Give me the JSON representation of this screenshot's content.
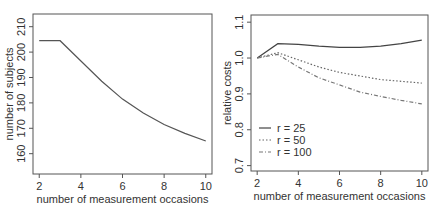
{
  "chart_data": [
    {
      "type": "line",
      "title": "",
      "xlabel": "number of measurement occasions",
      "ylabel": "number of subjects",
      "x": [
        2,
        3,
        4,
        5,
        6,
        7,
        8,
        9,
        10
      ],
      "series": [
        {
          "name": "number of subjects",
          "values": [
            204.5,
            204.5,
            196.5,
            188.5,
            181.5,
            176,
            171.5,
            168,
            165
          ],
          "style": "solid",
          "color": "#555555"
        }
      ],
      "xticks": [
        2,
        4,
        6,
        8,
        10
      ],
      "yticks": [
        160,
        170,
        180,
        190,
        200,
        210
      ],
      "xlim": [
        1.7,
        10.3
      ],
      "ylim": [
        152,
        215
      ],
      "grid": false,
      "legend": null
    },
    {
      "type": "line",
      "title": "",
      "xlabel": "number of measurement occasions",
      "ylabel": "relative costs",
      "x": [
        2,
        3,
        4,
        5,
        6,
        7,
        8,
        9,
        10
      ],
      "series": [
        {
          "name": "r = 25",
          "values": [
            1.0,
            1.04,
            1.038,
            1.033,
            1.03,
            1.03,
            1.033,
            1.04,
            1.05
          ],
          "style": "solid",
          "color": "#444444"
        },
        {
          "name": "r = 50",
          "values": [
            1.0,
            1.015,
            0.995,
            0.975,
            0.96,
            0.95,
            0.94,
            0.935,
            0.93
          ],
          "style": "dotted",
          "color": "#666666"
        },
        {
          "name": "r = 100",
          "values": [
            1.0,
            1.01,
            0.975,
            0.945,
            0.925,
            0.905,
            0.893,
            0.882,
            0.872
          ],
          "style": "dashdot",
          "color": "#777777"
        }
      ],
      "xticks": [
        2,
        4,
        6,
        8,
        10
      ],
      "yticks": [
        0.7,
        0.8,
        0.9,
        1.0,
        1.1
      ],
      "ytick_labels": [
        "0.7",
        "0.8",
        "0.9",
        "1.0",
        "1.1"
      ],
      "xlim": [
        1.7,
        10.3
      ],
      "ylim": [
        0.685,
        1.12
      ],
      "grid": false,
      "legend": {
        "position": "lower left",
        "entries": [
          "r = 25",
          "r = 50",
          "r = 100"
        ]
      }
    }
  ]
}
